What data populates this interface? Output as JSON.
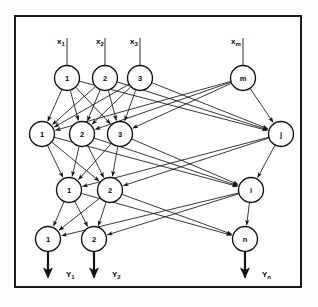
{
  "figure": {
    "kind": "neural-network-architecture-diagram",
    "frame": {
      "border_color": "#1a1a1a",
      "background": "#ffffff"
    },
    "ink_color": "#141414"
  },
  "inputs": [
    {
      "id": "x1",
      "label": "x",
      "subscript": "1",
      "x": 57,
      "y": 44
    },
    {
      "id": "x2",
      "label": "x",
      "subscript": "2",
      "x": 96,
      "y": 44
    },
    {
      "id": "x3",
      "label": "x",
      "subscript": "3",
      "x": 130,
      "y": 44
    },
    {
      "id": "xm",
      "label": "x",
      "subscript": "m",
      "x": 231,
      "y": 44
    }
  ],
  "outputs": [
    {
      "id": "y1",
      "label": "Y",
      "subscript": "1",
      "x": 66,
      "y": 277
    },
    {
      "id": "y2",
      "label": "Y",
      "subscript": "2",
      "x": 112,
      "y": 277
    },
    {
      "id": "yn",
      "label": "Y",
      "subscript": "n",
      "x": 262,
      "y": 277
    }
  ],
  "layers": [
    {
      "name": "input-layer",
      "nodes": [
        {
          "id": "L1N1",
          "label": "1",
          "cx": 67,
          "cy": 78,
          "r": 12.5
        },
        {
          "id": "L1N2",
          "label": "2",
          "cx": 105,
          "cy": 78,
          "r": 12.5
        },
        {
          "id": "L1N3",
          "label": "3",
          "cx": 140,
          "cy": 78,
          "r": 12.5
        },
        {
          "id": "L1Nm",
          "label": "m",
          "cx": 243,
          "cy": 78,
          "r": 12.5
        }
      ]
    },
    {
      "name": "hidden-layer-1",
      "nodes": [
        {
          "id": "L2N1",
          "label": "1",
          "cx": 42,
          "cy": 134,
          "r": 12.5
        },
        {
          "id": "L2N2",
          "label": "2",
          "cx": 82,
          "cy": 134,
          "r": 12.5
        },
        {
          "id": "L2N3",
          "label": "3",
          "cx": 120,
          "cy": 134,
          "r": 12.5
        },
        {
          "id": "L2Nj",
          "label": "j",
          "cx": 281,
          "cy": 134,
          "r": 12.5
        }
      ]
    },
    {
      "name": "hidden-layer-2",
      "nodes": [
        {
          "id": "L3N1",
          "label": "1",
          "cx": 69,
          "cy": 190,
          "r": 12.5
        },
        {
          "id": "L3N2",
          "label": "2",
          "cx": 110,
          "cy": 190,
          "r": 12.5
        },
        {
          "id": "L3Ni",
          "label": "i",
          "cx": 251,
          "cy": 190,
          "r": 12.5
        }
      ]
    },
    {
      "name": "output-layer",
      "nodes": [
        {
          "id": "L4N1",
          "label": "1",
          "cx": 48,
          "cy": 239,
          "r": 12.5
        },
        {
          "id": "L4N2",
          "label": "2",
          "cx": 94,
          "cy": 239,
          "r": 12.5
        },
        {
          "id": "L4Nn",
          "label": "n",
          "cx": 245,
          "cy": 239,
          "r": 12.5
        }
      ]
    }
  ],
  "edges": {
    "input_to_hidden1": [
      [
        "L1N1",
        "L2N1"
      ],
      [
        "L1N1",
        "L2N2"
      ],
      [
        "L1N1",
        "L2N3"
      ],
      [
        "L1N2",
        "L2N1"
      ],
      [
        "L1N2",
        "L2N2"
      ],
      [
        "L1N2",
        "L2N3"
      ],
      [
        "L1N3",
        "L2N1"
      ],
      [
        "L1N3",
        "L2N2"
      ],
      [
        "L1N3",
        "L2N3"
      ],
      [
        "L1Nm",
        "L2N1"
      ],
      [
        "L1Nm",
        "L2N2"
      ],
      [
        "L1Nm",
        "L2N3"
      ],
      [
        "L1N1",
        "L2Nj"
      ],
      [
        "L1N2",
        "L2Nj"
      ],
      [
        "L1N3",
        "L2Nj"
      ],
      [
        "L1Nm",
        "L2Nj"
      ]
    ],
    "hidden1_to_hidden2": [
      [
        "L2N1",
        "L3N1"
      ],
      [
        "L2N1",
        "L3N2"
      ],
      [
        "L2N2",
        "L3N1"
      ],
      [
        "L2N2",
        "L3N2"
      ],
      [
        "L2N3",
        "L3N1"
      ],
      [
        "L2N3",
        "L3N2"
      ],
      [
        "L2Nj",
        "L3N1"
      ],
      [
        "L2Nj",
        "L3N2"
      ],
      [
        "L2N1",
        "L3Ni"
      ],
      [
        "L2N2",
        "L3Ni"
      ],
      [
        "L2N3",
        "L3Ni"
      ],
      [
        "L2Nj",
        "L3Ni"
      ]
    ],
    "hidden2_to_output": [
      [
        "L3N1",
        "L4N1"
      ],
      [
        "L3N1",
        "L4N2"
      ],
      [
        "L3N2",
        "L4N1"
      ],
      [
        "L3N2",
        "L4N2"
      ],
      [
        "L3Ni",
        "L4N1"
      ],
      [
        "L3Ni",
        "L4N2"
      ],
      [
        "L3N1",
        "L4Nn"
      ],
      [
        "L3N2",
        "L4Nn"
      ],
      [
        "L3Ni",
        "L4Nn"
      ]
    ]
  }
}
